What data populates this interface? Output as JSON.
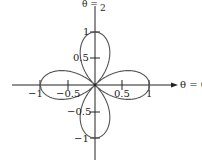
{
  "chart_data": {
    "type": "line",
    "subtype": "polar",
    "title": "",
    "equation": "r = cos(2θ)",
    "curve_description": "Four-petaled rose curve with petals along positive/negative x and y axes, each reaching r = 1",
    "axis_labels": {
      "theta_zero": "θ = 0",
      "theta_half_pi": "θ = π/2"
    },
    "x_ticks": [
      "−1",
      "−0.5",
      "0.5",
      "1"
    ],
    "y_ticks": [
      "1",
      "0.5",
      "−0.5",
      "−1"
    ],
    "xlim": [
      -1,
      1
    ],
    "ylim": [
      -1,
      1
    ],
    "grid": false,
    "legend": null,
    "petal_tips": [
      {
        "theta": "0",
        "r": 1
      },
      {
        "theta": "π/2",
        "r": 1
      },
      {
        "theta": "π",
        "r": 1
      },
      {
        "theta": "3π/2",
        "r": 1
      }
    ],
    "colors": {
      "curve": "#555555",
      "axes": "#222222"
    }
  },
  "labels": {
    "theta_zero": "θ = 0",
    "theta_half_pi_prefix": "θ = ",
    "theta_half_pi_num": "π",
    "theta_half_pi_den": "2",
    "x_neg1": "−1",
    "x_neg05": "−0.5",
    "x_pos05": "0.5",
    "x_pos1": "1",
    "y_pos1": "1",
    "y_pos05": "0.5",
    "y_neg05": "−0.5",
    "y_neg1": "−1"
  }
}
